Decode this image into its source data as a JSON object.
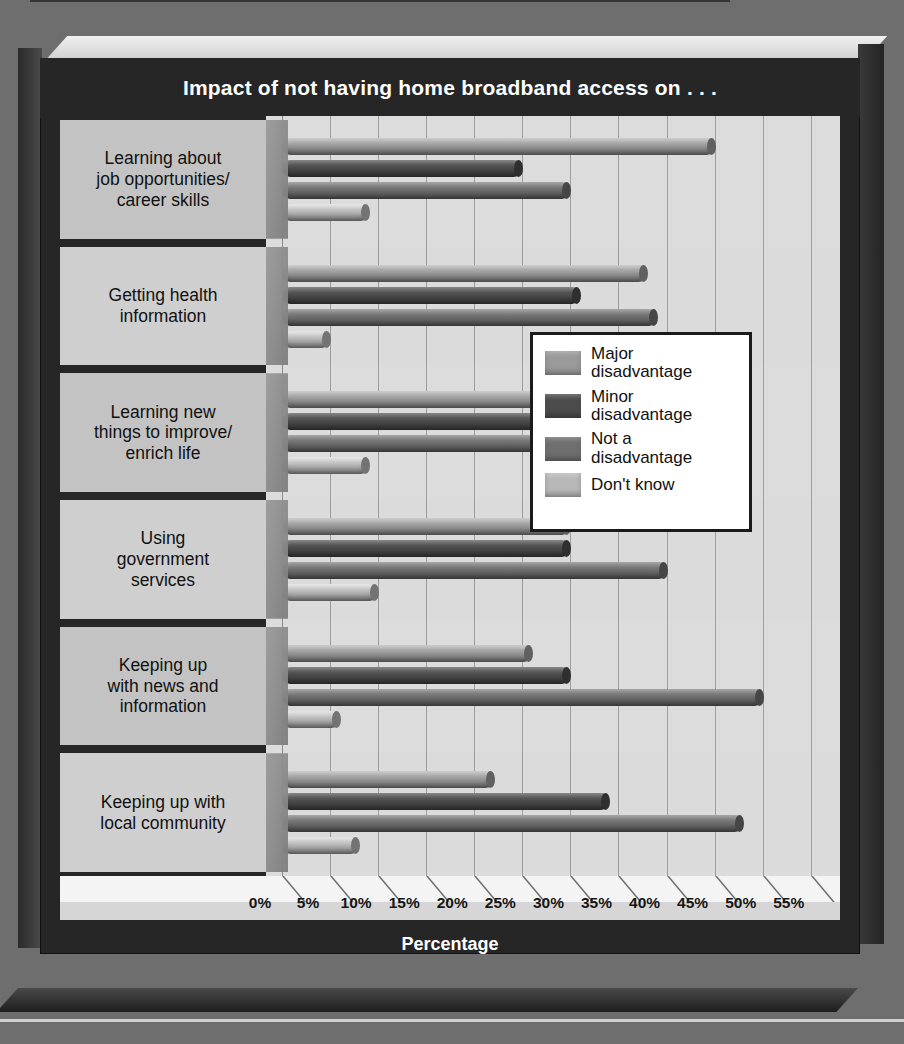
{
  "chart_data": {
    "type": "bar",
    "orientation": "horizontal-grouped",
    "title": "Impact of not having home broadband access on . . .",
    "xlabel": "Percentage",
    "ylabel": "",
    "xlim": [
      0,
      57
    ],
    "grid": true,
    "legend_position": "center-right",
    "xticks": [
      "0%",
      "5%",
      "10%",
      "15%",
      "20%",
      "25%",
      "30%",
      "35%",
      "40%",
      "45%",
      "50%",
      "55%"
    ],
    "xtick_values": [
      0,
      5,
      10,
      15,
      20,
      25,
      30,
      35,
      40,
      45,
      50,
      55
    ],
    "categories": [
      "Learning about job opportunities/ career skills",
      "Getting health information",
      "Learning new things to improve/ enrich life",
      "Using government services",
      "Keeping up with news and information",
      "Keeping up with local community"
    ],
    "series": [
      {
        "name": "Major disadvantage",
        "color": "#9a9a9a",
        "values": [
          45,
          38,
          37,
          30,
          26,
          22
        ]
      },
      {
        "name": "Minor disadvantage",
        "color": "#4c4c4c",
        "values": [
          25,
          31,
          36,
          30,
          30,
          34
        ]
      },
      {
        "name": "Not a disadvantage",
        "color": "#6f6f6f",
        "values": [
          30,
          39,
          37,
          40,
          50,
          48
        ]
      },
      {
        "name": "Don't know",
        "color": "#b8b8b8",
        "values": [
          9,
          5,
          9,
          10,
          6,
          8
        ]
      }
    ]
  },
  "header": {
    "title": "Impact of not having home broadband access on . . ."
  },
  "axis": {
    "x_title": "Percentage",
    "ticks": [
      "0%",
      "5%",
      "10%",
      "15%",
      "20%",
      "25%",
      "30%",
      "35%",
      "40%",
      "45%",
      "50%",
      "55%"
    ]
  },
  "categories": [
    {
      "line1": "Learning about",
      "line2": "job opportunities/",
      "line3": "career skills"
    },
    {
      "line1": "Getting health",
      "line2": "information",
      "line3": ""
    },
    {
      "line1": "Learning new",
      "line2": "things to improve/",
      "line3": "enrich life"
    },
    {
      "line1": "Using",
      "line2": "government",
      "line3": "services"
    },
    {
      "line1": "Keeping up",
      "line2": "with news and",
      "line3": "information"
    },
    {
      "line1": "Keeping up with",
      "line2": "local community",
      "line3": ""
    }
  ],
  "legend": {
    "items": [
      {
        "label_line1": "Major",
        "label_line2": "disadvantage",
        "color": "#9a9a9a"
      },
      {
        "label_line1": "Minor",
        "label_line2": "disadvantage",
        "color": "#4c4c4c"
      },
      {
        "label_line1": "Not a",
        "label_line2": "disadvantage",
        "color": "#6f6f6f"
      },
      {
        "label_line1": "Don't know",
        "label_line2": "",
        "color": "#b8b8b8"
      }
    ]
  },
  "colors": {
    "background": "#6e6e6e",
    "panel_dark": "#262626",
    "plot_area": "#dcdcdc",
    "category_band": "#c3c3c3",
    "category_band_alt": "#cfcfcf",
    "title_text": "#ffffff",
    "gridline": "#9d9d9d"
  }
}
